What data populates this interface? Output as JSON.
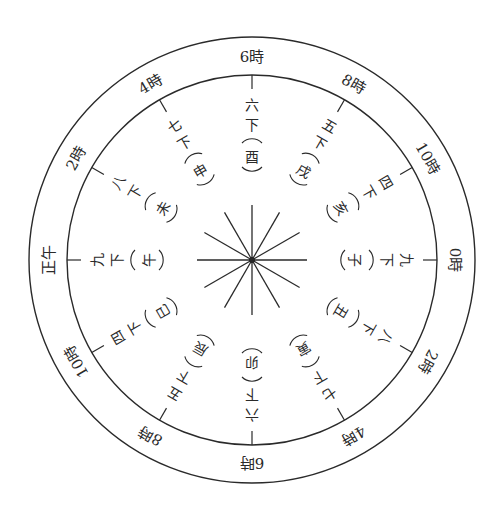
{
  "diagram": {
    "center": {
      "x": 252,
      "y": 260
    },
    "outer_radius": 223,
    "inner_radius": 185,
    "line_color": "#2a2a2a",
    "hours": [
      {
        "angle": 0,
        "label": "6時"
      },
      {
        "angle": 30,
        "label": "8時"
      },
      {
        "angle": 60,
        "label": "10時"
      },
      {
        "angle": 90,
        "label": "0時"
      },
      {
        "angle": 120,
        "label": "2時"
      },
      {
        "angle": 150,
        "label": "4時"
      },
      {
        "angle": 180,
        "label": "6時"
      },
      {
        "angle": 210,
        "label": "8時"
      },
      {
        "angle": 240,
        "label": "10時"
      },
      {
        "angle": 270,
        "label": "正午"
      },
      {
        "angle": 300,
        "label": "2時"
      },
      {
        "angle": 330,
        "label": "4時"
      }
    ],
    "segments": [
      {
        "angle": 0,
        "count": "六",
        "suffix": "下",
        "branch": "酉"
      },
      {
        "angle": 30,
        "count": "五",
        "suffix": "下",
        "branch": "戌"
      },
      {
        "angle": 60,
        "count": "四",
        "suffix": "下",
        "branch": "亥"
      },
      {
        "angle": 90,
        "count": "九",
        "suffix": "下",
        "branch": "子"
      },
      {
        "angle": 120,
        "count": "八",
        "suffix": "下",
        "branch": "丑"
      },
      {
        "angle": 150,
        "count": "七",
        "suffix": "下",
        "branch": "寅"
      },
      {
        "angle": 180,
        "count": "六",
        "suffix": "下",
        "branch": "卯"
      },
      {
        "angle": 210,
        "count": "五",
        "suffix": "下",
        "branch": "辰"
      },
      {
        "angle": 240,
        "count": "四",
        "suffix": "下",
        "branch": "巳"
      },
      {
        "angle": 270,
        "count": "九",
        "suffix": "下",
        "branch": "午"
      },
      {
        "angle": 300,
        "count": "八",
        "suffix": "下",
        "branch": "未"
      },
      {
        "angle": 330,
        "count": "七",
        "suffix": "下",
        "branch": "申"
      }
    ]
  }
}
